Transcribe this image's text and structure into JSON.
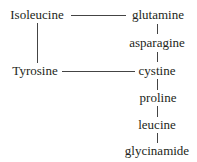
{
  "diagram": {
    "left_nodes": [
      {
        "id": "isoleucine",
        "label": "Isoleucine"
      },
      {
        "id": "tyrosine",
        "label": "Tyrosine"
      }
    ],
    "chain": [
      {
        "id": "glutamine",
        "label": "glutamine"
      },
      {
        "id": "asparagine",
        "label": "asparagine"
      },
      {
        "id": "cystine",
        "label": "cystine"
      },
      {
        "id": "proline",
        "label": "proline"
      },
      {
        "id": "leucine",
        "label": "leucine"
      },
      {
        "id": "glycinamide",
        "label": "glycinamide"
      }
    ],
    "edges": [
      [
        "Isoleucine",
        "glutamine"
      ],
      [
        "Isoleucine",
        "Tyrosine"
      ],
      [
        "Tyrosine",
        "cystine"
      ],
      [
        "glutamine",
        "asparagine"
      ],
      [
        "asparagine",
        "cystine"
      ],
      [
        "cystine",
        "proline"
      ],
      [
        "proline",
        "leucine"
      ],
      [
        "leucine",
        "glycinamide"
      ]
    ],
    "line_color": "#444444",
    "text_color": "#231f20"
  }
}
